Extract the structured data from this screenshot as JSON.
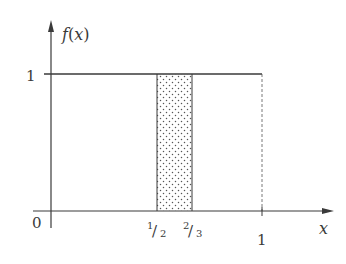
{
  "diagram": {
    "type": "probability-density-plot",
    "function": "uniform density f(x)=1 on [0,1] with shaded interval [1/2, 2/3]",
    "y_axis_label": "f(x)",
    "x_axis_label": "x",
    "origin_label": "0",
    "y_tick_label": "1",
    "x_tick_labels": {
      "half_num": "1",
      "half_den": "2",
      "two_thirds_num": "2",
      "two_thirds_den": "3",
      "one": "1"
    },
    "shaded_interval": {
      "from": "1/2",
      "to": "2/3",
      "pattern": "dotted"
    },
    "colors": {
      "line": "#3a3a3a",
      "dots": "#555555",
      "background": "#ffffff"
    }
  }
}
